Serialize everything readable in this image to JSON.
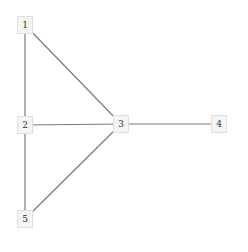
{
  "diagram": {
    "type": "graph",
    "edge_color": "#7a7a7a",
    "node_fill": "#f4f4f4",
    "node_border": "#e0e0e0",
    "nodes": [
      {
        "id": "1",
        "label": "1",
        "x": 25,
        "y": 25
      },
      {
        "id": "2",
        "label": "2",
        "x": 25,
        "y": 125
      },
      {
        "id": "3",
        "label": "3",
        "x": 121,
        "y": 124
      },
      {
        "id": "4",
        "label": "4",
        "x": 219,
        "y": 124
      },
      {
        "id": "5",
        "label": "5",
        "x": 25,
        "y": 219
      }
    ],
    "edges": [
      {
        "from": "1",
        "to": "2"
      },
      {
        "from": "1",
        "to": "3"
      },
      {
        "from": "2",
        "to": "3"
      },
      {
        "from": "2",
        "to": "5"
      },
      {
        "from": "3",
        "to": "5"
      },
      {
        "from": "3",
        "to": "4"
      }
    ]
  }
}
